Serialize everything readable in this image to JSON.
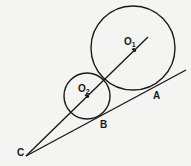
{
  "diagram": {
    "type": "geometry",
    "colors": {
      "ink": "#1a1a1a",
      "paper": "#f4f4f2"
    },
    "circles": [
      {
        "id": "O1",
        "label": "O",
        "subscript": "1",
        "cx": 133,
        "cy": 48,
        "r": 42
      },
      {
        "id": "O2",
        "label": "O",
        "subscript": "2",
        "cx": 87,
        "cy": 96,
        "r": 23
      }
    ],
    "points": [
      {
        "id": "A",
        "label": "A",
        "x": 156,
        "y": 88
      },
      {
        "id": "B",
        "label": "B",
        "x": 103,
        "y": 117
      },
      {
        "id": "C",
        "label": "C",
        "x": 26,
        "y": 156
      }
    ],
    "lines": [
      {
        "from": "C",
        "to": "through O2, O1",
        "x1": 26,
        "y1": 156,
        "x2": 148,
        "y2": 37
      },
      {
        "from": "C",
        "to": "tangent through B, A",
        "x1": 26,
        "y1": 156,
        "x2": 186,
        "y2": 70
      }
    ]
  }
}
